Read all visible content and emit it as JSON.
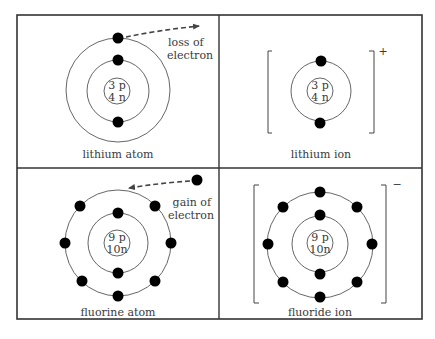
{
  "panels": [
    {
      "id": "lithium-atom",
      "label": "lithium atom",
      "nucleus": {
        "protons": "3 p",
        "neutrons": "4 n"
      },
      "shells": [
        2,
        1
      ],
      "annotation": {
        "line1": "loss of",
        "line2": "electron"
      }
    },
    {
      "id": "lithium-ion",
      "label": "lithium ion",
      "nucleus": {
        "protons": "3 p",
        "neutrons": "4 n"
      },
      "shells": [
        2
      ],
      "charge": "+"
    },
    {
      "id": "fluorine-atom",
      "label": "fluorine atom",
      "nucleus": {
        "protons": "9 p",
        "neutrons": "10n"
      },
      "shells": [
        2,
        7
      ],
      "annotation": {
        "line1": "gain of",
        "line2": "electron"
      }
    },
    {
      "id": "fluoride-ion",
      "label": "fluoride ion",
      "nucleus": {
        "protons": "9 p",
        "neutrons": "10n"
      },
      "shells": [
        2,
        8
      ],
      "charge": "−"
    }
  ],
  "electron_symbol": "−"
}
